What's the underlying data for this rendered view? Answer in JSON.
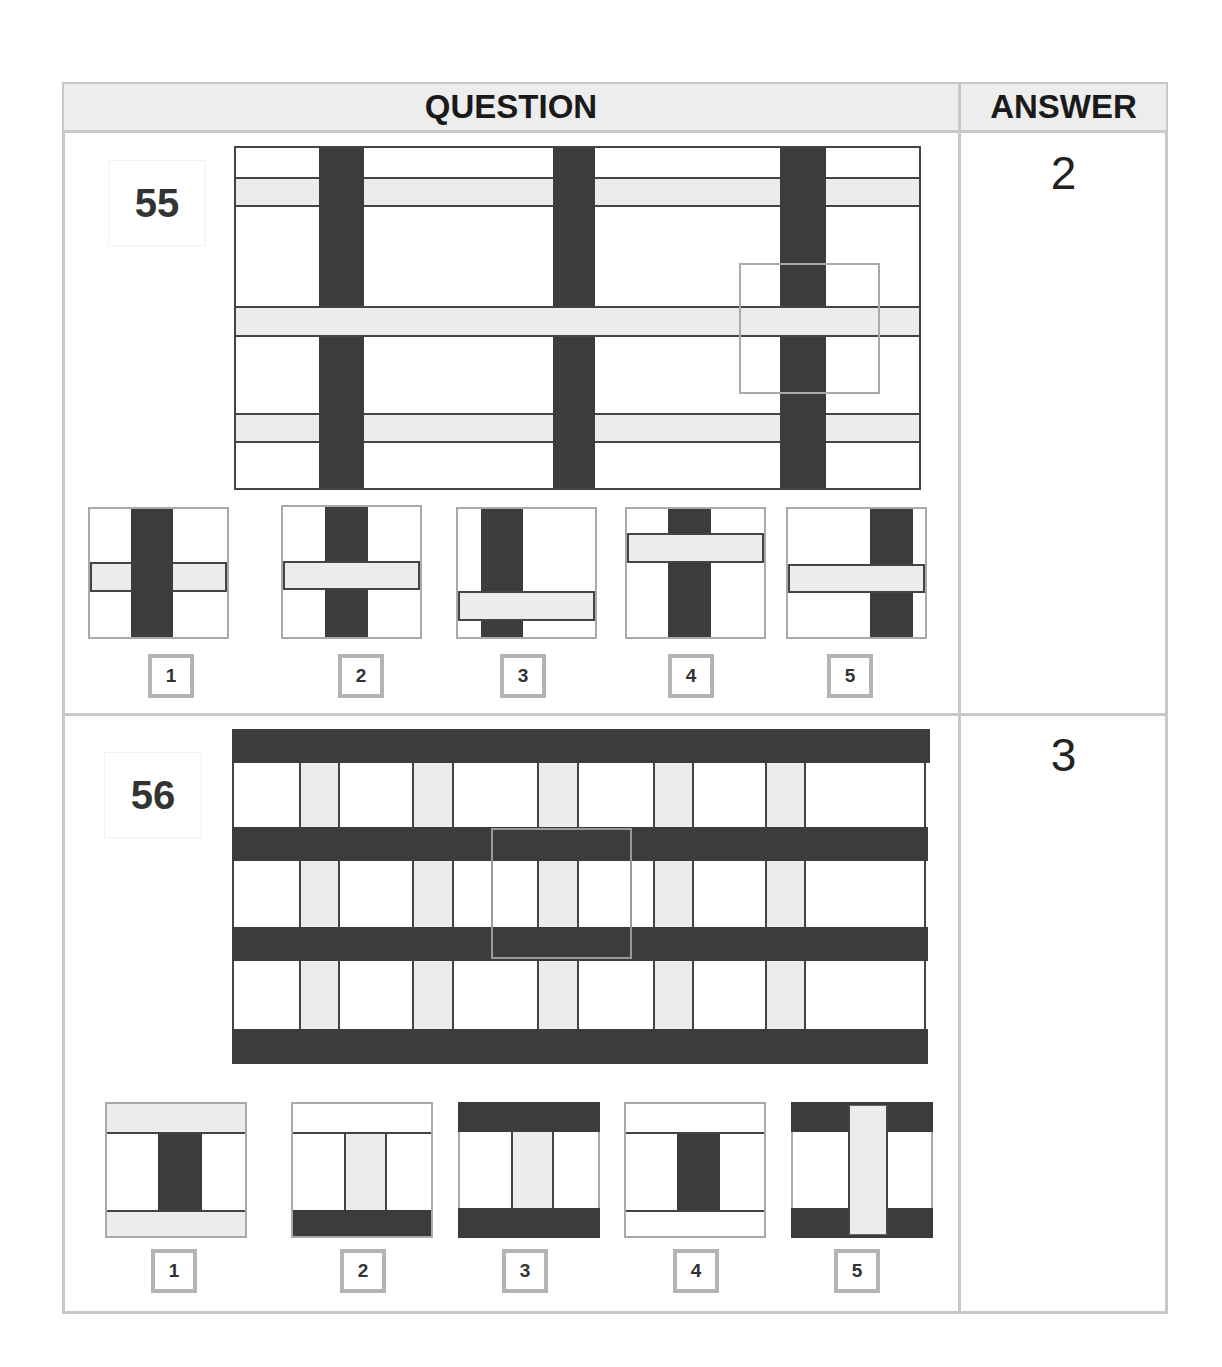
{
  "header": {
    "question_label": "QUESTION",
    "answer_label": "ANSWER"
  },
  "colors": {
    "dark_bar": "#3c3c3c",
    "light_bar": "#ececec",
    "table_border": "#c8c8c8",
    "header_bg": "#ededed"
  },
  "questions": [
    {
      "number": "55",
      "answer": "2",
      "options": [
        {
          "label": "1",
          "description": "dark vertical bar over light horizontal stripe"
        },
        {
          "label": "2",
          "description": "light horizontal stripe over dark vertical bar"
        },
        {
          "label": "3",
          "description": "light stripe low, over dark bar offset left"
        },
        {
          "label": "4",
          "description": "light stripe high, over dark bar"
        },
        {
          "label": "5",
          "description": "light stripe over dark bar offset right"
        }
      ]
    },
    {
      "number": "56",
      "answer": "3",
      "options": [
        {
          "label": "1",
          "description": "light bands top/bottom, dark vertical center"
        },
        {
          "label": "2",
          "description": "white top band, dark bottom band, light vertical center"
        },
        {
          "label": "3",
          "description": "dark bands top/bottom, light vertical center"
        },
        {
          "label": "4",
          "description": "white bands top/bottom, dark vertical center"
        },
        {
          "label": "5",
          "description": "dark bands top/bottom, light vertical over bands"
        }
      ]
    }
  ]
}
